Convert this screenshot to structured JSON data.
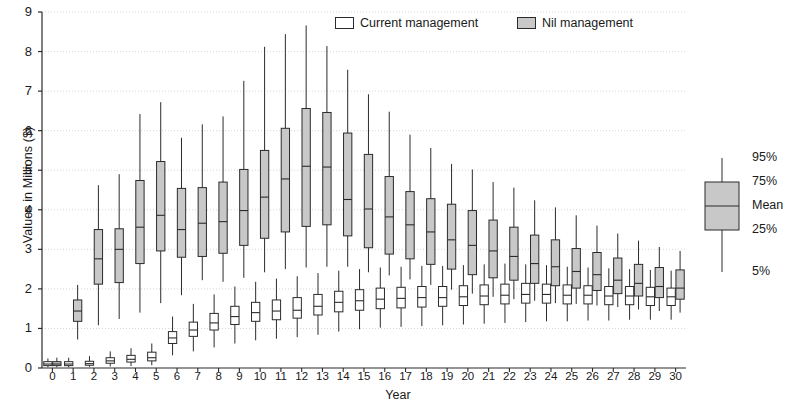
{
  "chart_data": {
    "type": "box",
    "title": "",
    "xlabel": "Year",
    "ylabel": "Values in Millions ($)",
    "ylim": [
      0,
      9
    ],
    "xlim": [
      -0.5,
      30.5
    ],
    "ytick_labels": [
      "0",
      "1",
      "2",
      "3",
      "4",
      "5",
      "6",
      "7",
      "8",
      "9"
    ],
    "yticks": [
      0,
      1,
      2,
      3,
      4,
      5,
      6,
      7,
      8,
      9
    ],
    "grid": "horizontal-dotted",
    "categories": [
      "0",
      "1",
      "2",
      "3",
      "4",
      "5",
      "6",
      "7",
      "8",
      "9",
      "10",
      "11",
      "12",
      "13",
      "14",
      "15",
      "16",
      "17",
      "18",
      "19",
      "20",
      "21",
      "22",
      "23",
      "24",
      "25",
      "26",
      "27",
      "28",
      "29",
      "30"
    ],
    "legend_position": "top-center",
    "box_key": {
      "position": "right-outside",
      "labels": [
        "95%",
        "75%",
        "Mean",
        "25%",
        "5%"
      ]
    },
    "series": [
      {
        "name": "Current management",
        "fill": "#ffffff",
        "stroke": "#2b2b2b",
        "boxes": [
          {
            "year": 0,
            "p5": 0.02,
            "p25": 0.06,
            "mean": 0.1,
            "p75": 0.16,
            "p95": 0.24
          },
          {
            "year": 1,
            "p5": 0.02,
            "p25": 0.06,
            "mean": 0.1,
            "p75": 0.16,
            "p95": 0.26
          },
          {
            "year": 2,
            "p5": 0.03,
            "p25": 0.07,
            "mean": 0.11,
            "p75": 0.17,
            "p95": 0.3
          },
          {
            "year": 3,
            "p5": 0.04,
            "p25": 0.12,
            "mean": 0.18,
            "p75": 0.26,
            "p95": 0.42
          },
          {
            "year": 4,
            "p5": 0.05,
            "p25": 0.15,
            "mean": 0.22,
            "p75": 0.32,
            "p95": 0.5
          },
          {
            "year": 5,
            "p5": 0.07,
            "p25": 0.18,
            "mean": 0.26,
            "p75": 0.4,
            "p95": 0.62
          },
          {
            "year": 6,
            "p5": 0.32,
            "p25": 0.62,
            "mean": 0.76,
            "p75": 0.92,
            "p95": 1.3
          },
          {
            "year": 7,
            "p5": 0.42,
            "p25": 0.8,
            "mean": 0.96,
            "p75": 1.16,
            "p95": 1.62
          },
          {
            "year": 8,
            "p5": 0.52,
            "p25": 0.96,
            "mean": 1.14,
            "p75": 1.38,
            "p95": 1.86
          },
          {
            "year": 9,
            "p5": 0.62,
            "p25": 1.1,
            "mean": 1.3,
            "p75": 1.56,
            "p95": 2.06
          },
          {
            "year": 10,
            "p5": 0.7,
            "p25": 1.18,
            "mean": 1.4,
            "p75": 1.66,
            "p95": 2.18
          },
          {
            "year": 11,
            "p5": 0.74,
            "p25": 1.22,
            "mean": 1.44,
            "p75": 1.72,
            "p95": 2.26
          },
          {
            "year": 12,
            "p5": 0.78,
            "p25": 1.26,
            "mean": 1.46,
            "p75": 1.78,
            "p95": 2.32
          },
          {
            "year": 13,
            "p5": 0.84,
            "p25": 1.34,
            "mean": 1.56,
            "p75": 1.86,
            "p95": 2.4
          },
          {
            "year": 14,
            "p5": 0.92,
            "p25": 1.42,
            "mean": 1.66,
            "p75": 1.94,
            "p95": 2.46
          },
          {
            "year": 15,
            "p5": 0.98,
            "p25": 1.46,
            "mean": 1.7,
            "p75": 1.98,
            "p95": 2.5
          },
          {
            "year": 16,
            "p5": 1.02,
            "p25": 1.5,
            "mean": 1.74,
            "p75": 2.02,
            "p95": 2.54
          },
          {
            "year": 17,
            "p5": 1.04,
            "p25": 1.52,
            "mean": 1.76,
            "p75": 2.04,
            "p95": 2.56
          },
          {
            "year": 18,
            "p5": 1.06,
            "p25": 1.54,
            "mean": 1.78,
            "p75": 2.06,
            "p95": 2.58
          },
          {
            "year": 19,
            "p5": 1.08,
            "p25": 1.56,
            "mean": 1.78,
            "p75": 2.06,
            "p95": 2.58
          },
          {
            "year": 20,
            "p5": 1.1,
            "p25": 1.58,
            "mean": 1.8,
            "p75": 2.08,
            "p95": 2.6
          },
          {
            "year": 21,
            "p5": 1.12,
            "p25": 1.6,
            "mean": 1.82,
            "p75": 2.1,
            "p95": 2.62
          },
          {
            "year": 22,
            "p5": 1.14,
            "p25": 1.62,
            "mean": 1.84,
            "p75": 2.12,
            "p95": 2.64
          },
          {
            "year": 23,
            "p5": 1.16,
            "p25": 1.64,
            "mean": 1.86,
            "p75": 2.14,
            "p95": 2.62
          },
          {
            "year": 24,
            "p5": 1.18,
            "p25": 1.64,
            "mean": 1.86,
            "p75": 2.12,
            "p95": 2.6
          },
          {
            "year": 25,
            "p5": 1.18,
            "p25": 1.62,
            "mean": 1.84,
            "p75": 2.1,
            "p95": 2.56
          },
          {
            "year": 26,
            "p5": 1.2,
            "p25": 1.62,
            "mean": 1.84,
            "p75": 2.08,
            "p95": 2.54
          },
          {
            "year": 27,
            "p5": 1.2,
            "p25": 1.6,
            "mean": 1.82,
            "p75": 2.06,
            "p95": 2.52
          },
          {
            "year": 28,
            "p5": 1.22,
            "p25": 1.6,
            "mean": 1.82,
            "p75": 2.06,
            "p95": 2.5
          },
          {
            "year": 29,
            "p5": 1.22,
            "p25": 1.58,
            "mean": 1.8,
            "p75": 2.04,
            "p95": 2.48
          },
          {
            "year": 30,
            "p5": 1.22,
            "p25": 1.58,
            "mean": 1.8,
            "p75": 2.02,
            "p95": 2.46
          }
        ]
      },
      {
        "name": "Nil management",
        "fill": "#c8c8c8",
        "stroke": "#2b2b2b",
        "boxes": [
          {
            "year": 0,
            "p5": 0.02,
            "p25": 0.06,
            "mean": 0.1,
            "p75": 0.16,
            "p95": 0.26
          },
          {
            "year": 1,
            "p5": 0.72,
            "p25": 1.18,
            "mean": 1.44,
            "p75": 1.72,
            "p95": 2.1
          },
          {
            "year": 2,
            "p5": 1.08,
            "p25": 2.12,
            "mean": 2.76,
            "p75": 3.5,
            "p95": 4.62
          },
          {
            "year": 3,
            "p5": 1.24,
            "p25": 2.16,
            "mean": 3.0,
            "p75": 3.52,
            "p95": 4.9
          },
          {
            "year": 4,
            "p5": 1.4,
            "p25": 2.64,
            "mean": 3.56,
            "p75": 4.74,
            "p95": 6.42
          },
          {
            "year": 5,
            "p5": 1.64,
            "p25": 2.96,
            "mean": 3.86,
            "p75": 5.22,
            "p95": 6.72
          },
          {
            "year": 6,
            "p5": 1.84,
            "p25": 2.8,
            "mean": 3.5,
            "p75": 4.54,
            "p95": 5.82
          },
          {
            "year": 7,
            "p5": 2.22,
            "p25": 2.82,
            "mean": 3.66,
            "p75": 4.56,
            "p95": 6.16
          },
          {
            "year": 8,
            "p5": 2.18,
            "p25": 2.9,
            "mean": 3.7,
            "p75": 4.7,
            "p95": 6.36
          },
          {
            "year": 9,
            "p5": 2.28,
            "p25": 3.1,
            "mean": 3.98,
            "p75": 5.02,
            "p95": 7.26
          },
          {
            "year": 10,
            "p5": 2.42,
            "p25": 3.28,
            "mean": 4.32,
            "p75": 5.5,
            "p95": 8.12
          },
          {
            "year": 11,
            "p5": 2.5,
            "p25": 3.44,
            "mean": 4.78,
            "p75": 6.06,
            "p95": 8.44
          },
          {
            "year": 12,
            "p5": 2.54,
            "p25": 3.58,
            "mean": 5.1,
            "p75": 6.56,
            "p95": 8.66
          },
          {
            "year": 13,
            "p5": 2.56,
            "p25": 3.62,
            "mean": 5.08,
            "p75": 6.46,
            "p95": 8.14
          },
          {
            "year": 14,
            "p5": 2.56,
            "p25": 3.34,
            "mean": 4.26,
            "p75": 5.94,
            "p95": 7.54
          },
          {
            "year": 15,
            "p5": 2.42,
            "p25": 3.04,
            "mean": 4.02,
            "p75": 5.4,
            "p95": 6.92
          },
          {
            "year": 16,
            "p5": 2.34,
            "p25": 2.88,
            "mean": 3.82,
            "p75": 4.84,
            "p95": 6.48
          },
          {
            "year": 17,
            "p5": 2.24,
            "p25": 2.76,
            "mean": 3.62,
            "p75": 4.46,
            "p95": 5.9
          },
          {
            "year": 18,
            "p5": 2.1,
            "p25": 2.62,
            "mean": 3.44,
            "p75": 4.28,
            "p95": 5.56
          },
          {
            "year": 19,
            "p5": 1.98,
            "p25": 2.5,
            "mean": 3.24,
            "p75": 4.14,
            "p95": 5.16
          },
          {
            "year": 20,
            "p5": 1.88,
            "p25": 2.36,
            "mean": 3.1,
            "p75": 3.98,
            "p95": 5.02
          },
          {
            "year": 21,
            "p5": 1.8,
            "p25": 2.28,
            "mean": 2.96,
            "p75": 3.74,
            "p95": 4.7
          },
          {
            "year": 22,
            "p5": 1.74,
            "p25": 2.22,
            "mean": 2.82,
            "p75": 3.56,
            "p95": 4.56
          },
          {
            "year": 23,
            "p5": 1.7,
            "p25": 2.14,
            "mean": 2.64,
            "p75": 3.36,
            "p95": 4.24
          },
          {
            "year": 24,
            "p5": 1.64,
            "p25": 2.08,
            "mean": 2.56,
            "p75": 3.24,
            "p95": 4.06
          },
          {
            "year": 25,
            "p5": 1.62,
            "p25": 2.02,
            "mean": 2.44,
            "p75": 3.02,
            "p95": 3.86
          },
          {
            "year": 26,
            "p5": 1.58,
            "p25": 1.96,
            "mean": 2.36,
            "p75": 2.92,
            "p95": 3.6
          },
          {
            "year": 27,
            "p5": 1.54,
            "p25": 1.88,
            "mean": 2.22,
            "p75": 2.78,
            "p95": 3.4
          },
          {
            "year": 28,
            "p5": 1.48,
            "p25": 1.82,
            "mean": 2.14,
            "p75": 2.62,
            "p95": 3.22
          },
          {
            "year": 29,
            "p5": 1.44,
            "p25": 1.78,
            "mean": 2.06,
            "p75": 2.54,
            "p95": 3.06
          },
          {
            "year": 30,
            "p5": 1.4,
            "p25": 1.74,
            "mean": 2.02,
            "p75": 2.48,
            "p95": 2.96
          }
        ]
      }
    ]
  },
  "legend": {
    "items": [
      {
        "label": "Current management",
        "style": "open"
      },
      {
        "label": "Nil management",
        "style": "filled"
      }
    ]
  },
  "colors": {
    "axis": "#2b2b2b",
    "grid": "#cccccc",
    "fill_nil": "#c8c8c8",
    "fill_current": "#ffffff",
    "text": "#1a1a1a"
  }
}
